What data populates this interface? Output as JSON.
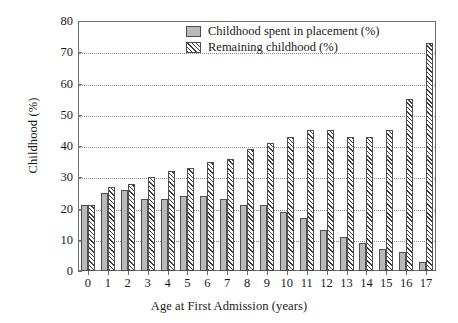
{
  "chart_data": {
    "type": "bar",
    "title": "",
    "xlabel": "Age at First Admission (years)",
    "ylabel": "Childhood (%)",
    "categories": [
      "0",
      "1",
      "2",
      "3",
      "4",
      "5",
      "6",
      "7",
      "8",
      "9",
      "10",
      "11",
      "12",
      "13",
      "14",
      "15",
      "16",
      "17"
    ],
    "series": [
      {
        "name": "Childhood spent in placement (%)",
        "values": [
          21,
          25,
          26,
          23,
          23,
          24,
          24,
          23,
          21,
          21,
          19,
          17,
          13,
          11,
          9,
          7,
          6,
          3
        ]
      },
      {
        "name": "Remaining childhood (%)",
        "values": [
          21,
          27,
          28,
          30,
          32,
          33,
          35,
          36,
          39,
          41,
          43,
          45,
          45,
          43,
          43,
          45,
          55,
          73
        ]
      }
    ],
    "ylim": [
      0,
      80
    ],
    "yticks": [
      0,
      10,
      20,
      30,
      40,
      50,
      60,
      70,
      80
    ],
    "grid": "horizontal-dotted",
    "legend_position": "upper-center",
    "colors": {
      "placement_fill": "#b9b9b9",
      "remaining_fill": "#ffffff",
      "hatch": "#3f3f3f",
      "bar_edge": "#4f4f4f",
      "axis": "#6d6d6d",
      "gridline": "#8d8d8d",
      "background": "#ffffff"
    }
  },
  "legend": {
    "items": [
      {
        "label": "Childhood spent in placement (%)",
        "swatch": "solid-grey-swatch"
      },
      {
        "label": "Remaining childhood (%)",
        "swatch": "diagonal-hatch-swatch"
      }
    ]
  }
}
